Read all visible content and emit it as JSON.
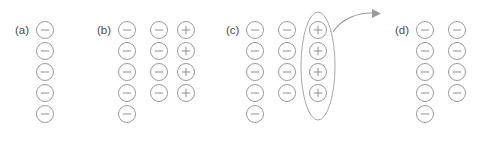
{
  "figure": {
    "width": 487,
    "height": 142,
    "background_color": "#ffffff",
    "circle_stroke_color": "#9a9a9a",
    "circle_fill_color": "#ffffff",
    "glyph_color": "#8f8f8f",
    "label_color": "#4a4a4a",
    "ellipse_color": "#a8a8a8",
    "arrow_color": "#9a9a9a",
    "circle_radius": 8.5,
    "row_spacing": 21,
    "first_row_center_y": 30
  },
  "panels": [
    {
      "id": "a",
      "label": "(a)",
      "label_x": 15,
      "label_y": 34,
      "columns": [
        {
          "id": "a-col-1",
          "center_x": 45,
          "charges": [
            "minus",
            "minus",
            "minus",
            "minus",
            "minus"
          ]
        }
      ],
      "highlight": null,
      "arrow": null
    },
    {
      "id": "b",
      "label": "(b)",
      "label_x": 97,
      "label_y": 34,
      "columns": [
        {
          "id": "b-col-1",
          "center_x": 127,
          "charges": [
            "minus",
            "minus",
            "minus",
            "minus",
            "minus"
          ]
        },
        {
          "id": "b-col-2",
          "center_x": 159,
          "charges": [
            "minus",
            "minus",
            "minus",
            "minus"
          ]
        },
        {
          "id": "b-col-3",
          "center_x": 186,
          "charges": [
            "plus",
            "plus",
            "plus",
            "plus"
          ]
        }
      ],
      "highlight": null,
      "arrow": null
    },
    {
      "id": "c",
      "label": "(c)",
      "label_x": 226,
      "label_y": 34,
      "columns": [
        {
          "id": "c-col-1",
          "center_x": 255,
          "charges": [
            "minus",
            "minus",
            "minus",
            "minus",
            "minus"
          ]
        },
        {
          "id": "c-col-2",
          "center_x": 287,
          "charges": [
            "minus",
            "minus",
            "minus",
            "minus"
          ]
        },
        {
          "id": "c-col-3",
          "center_x": 318,
          "charges": [
            "plus",
            "plus",
            "plus",
            "plus"
          ]
        }
      ],
      "highlight": {
        "id": "c-plus-column-highlight",
        "center_x": 318,
        "center_y": 66,
        "radius_x": 17,
        "radius_y": 54
      },
      "arrow": {
        "id": "c-motion-arrow",
        "path": "M 333 32 C 342 18, 358 13, 372 13",
        "head": "372,9 381,13.5 372,18"
      }
    },
    {
      "id": "d",
      "label": "(d)",
      "label_x": 395,
      "label_y": 34,
      "columns": [
        {
          "id": "d-col-1",
          "center_x": 425,
          "charges": [
            "minus",
            "minus",
            "minus",
            "minus",
            "minus"
          ]
        },
        {
          "id": "d-col-2",
          "center_x": 457,
          "charges": [
            "minus",
            "minus",
            "minus",
            "minus"
          ]
        }
      ],
      "highlight": null,
      "arrow": null
    }
  ]
}
